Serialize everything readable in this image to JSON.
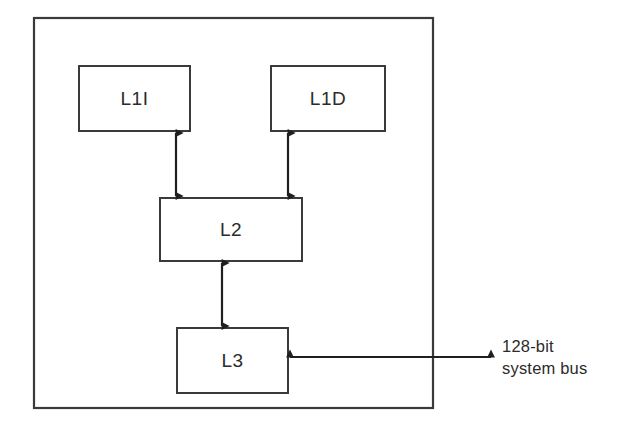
{
  "diagram": {
    "chip_boundary": {
      "name": "processor-chip-boundary",
      "x": 33,
      "y": 17,
      "width": 401,
      "height": 392
    },
    "boxes": [
      {
        "id": "l1i",
        "label": "L1I",
        "x": 78,
        "y": 65,
        "width": 113,
        "height": 67
      },
      {
        "id": "l1d",
        "label": "L1D",
        "x": 270,
        "y": 65,
        "width": 116,
        "height": 67
      },
      {
        "id": "l2",
        "label": "L2",
        "x": 159,
        "y": 197,
        "width": 144,
        "height": 65
      },
      {
        "id": "l3",
        "label": "L3",
        "x": 176,
        "y": 327,
        "width": 113,
        "height": 67
      }
    ],
    "connectors": [
      {
        "id": "l1i-l2",
        "from": "l1i",
        "to": "l2",
        "orientation": "vertical",
        "arrowheads": "both",
        "x": 176,
        "y1": 132,
        "y2": 197
      },
      {
        "id": "l1d-l2",
        "from": "l1d",
        "to": "l2",
        "orientation": "vertical",
        "arrowheads": "both",
        "x": 288,
        "y1": 132,
        "y2": 197
      },
      {
        "id": "l2-l3",
        "from": "l2",
        "to": "l3",
        "orientation": "vertical",
        "arrowheads": "both",
        "x": 222,
        "y1": 262,
        "y2": 327
      },
      {
        "id": "l3-bus",
        "from": "l3",
        "to": "system-bus",
        "orientation": "horizontal",
        "arrowheads": "both",
        "y": 357,
        "x1": 289,
        "x2": 492
      }
    ],
    "bus_label": {
      "id": "system-bus-label",
      "line1": "128-bit",
      "line2": "system bus",
      "x": 500,
      "y": 340
    },
    "colors": {
      "background": "#ffffff",
      "box_stroke": "#3a3a3a",
      "line": "#1f1f1f",
      "text": "#2b2b2b"
    }
  }
}
